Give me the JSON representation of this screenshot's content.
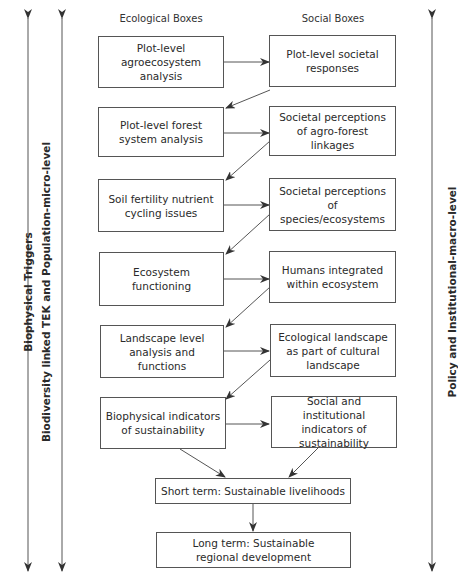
{
  "headers": {
    "ecological": "Ecological Boxes",
    "social": "Social Boxes"
  },
  "axes": {
    "left_outer": "Biophysical Triggers",
    "left_inner": "Biodiversity linked TEK and Population-micro-level",
    "right": "Policy and Institutional-macro-level"
  },
  "ecological_boxes": [
    "Plot-level agroecosystem analysis",
    "Plot-level forest system analysis",
    "Soil fertility nutrient cycling issues",
    "Ecosystem functioning",
    "Landscape level analysis and functions",
    "Biophysical indicators of sustainability"
  ],
  "social_boxes": [
    "Plot-level societal responses",
    "Societal perceptions of agro-forest linkages",
    "Societal perceptions of species/ecosystems",
    "Humans integrated within ecosystem",
    "Ecological landscape as part of cultural landscape",
    "Social and institutional indicators of sustainability"
  ],
  "outcomes": {
    "short_term": "Short term: Sustainable livelihoods",
    "long_term": "Long term: Sustainable regional development"
  },
  "colors": {
    "line": "#555555",
    "text": "#2a2a2a",
    "background": "#ffffff"
  }
}
